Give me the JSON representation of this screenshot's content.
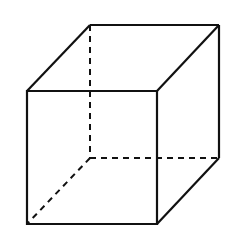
{
  "diagram": {
    "type": "cube",
    "stroke": "#111111",
    "background": "#ffffff",
    "front_face": [
      [
        27,
        91
      ],
      [
        157,
        91
      ],
      [
        157,
        224
      ],
      [
        27,
        224
      ]
    ],
    "back_face": [
      [
        90,
        25
      ],
      [
        219,
        25
      ],
      [
        219,
        158
      ],
      [
        90,
        158
      ]
    ],
    "hidden_edges": "dashed"
  }
}
